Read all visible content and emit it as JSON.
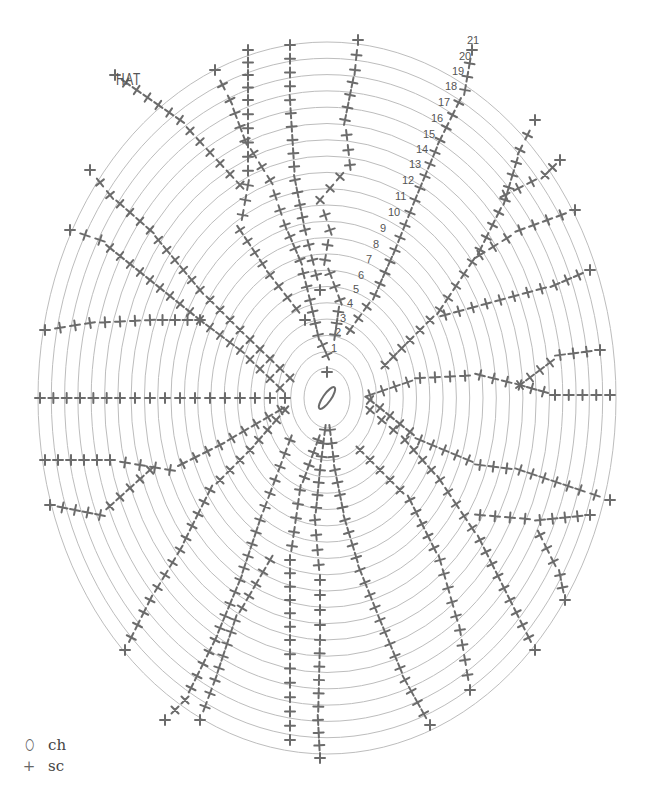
{
  "title": "HAT",
  "legend": [
    {
      "symbol": "oval",
      "glyph": "⬯",
      "label": "ch"
    },
    {
      "symbol": "plus",
      "glyph": "+",
      "label": "sc"
    }
  ],
  "colors": {
    "ring": "#bdbdbd",
    "stitch": "#6b6b6b",
    "text": "#555555"
  },
  "diagram": {
    "center": [
      327,
      398
    ],
    "rounds": 21,
    "ring_rx_start": 23,
    "ring_rx_step": 13.3,
    "ring_ry_start": 30,
    "ring_ry_step": 16.3,
    "round_labels": [
      "1",
      "2",
      "3",
      "4",
      "5",
      "6",
      "7",
      "8",
      "9",
      "10",
      "11",
      "12",
      "13",
      "14",
      "15",
      "16",
      "17",
      "18",
      "19",
      "20",
      "21"
    ],
    "round_label_positions": [
      [
        331,
        352
      ],
      [
        335,
        336
      ],
      [
        340,
        322
      ],
      [
        347,
        307
      ],
      [
        353,
        293
      ],
      [
        358,
        279
      ],
      [
        366,
        263
      ],
      [
        373,
        248
      ],
      [
        380,
        232
      ],
      [
        388,
        216
      ],
      [
        395,
        200
      ],
      [
        402,
        184
      ],
      [
        409,
        168
      ],
      [
        416,
        153
      ],
      [
        423,
        138
      ],
      [
        431,
        122
      ],
      [
        438,
        106
      ],
      [
        445,
        90
      ],
      [
        452,
        75
      ],
      [
        459,
        60
      ],
      [
        467,
        44
      ]
    ],
    "spokes": [
      {
        "name": "spoke-top",
        "pts": [
          [
            327,
            372
          ],
          [
            327,
            355
          ],
          [
            318,
            335
          ],
          [
            310,
            300
          ],
          [
            300,
            260
          ],
          [
            285,
            225
          ],
          [
            270,
            180
          ],
          [
            245,
            140
          ],
          [
            230,
            100
          ],
          [
            215,
            70
          ]
        ]
      },
      {
        "name": "spoke-top-2",
        "pts": [
          [
            335,
            335
          ],
          [
            340,
            300
          ],
          [
            325,
            260
          ],
          [
            330,
            230
          ],
          [
            320,
            200
          ],
          [
            350,
            165
          ],
          [
            345,
            120
          ],
          [
            355,
            70
          ],
          [
            358,
            40
          ]
        ]
      },
      {
        "name": "spoke-top-3",
        "pts": [
          [
            248,
            50
          ],
          [
            248,
            100
          ],
          [
            248,
            185
          ],
          [
            240,
            230
          ],
          [
            270,
            275
          ],
          [
            305,
            320
          ]
        ]
      },
      {
        "name": "spoke-top-4",
        "pts": [
          [
            290,
            45
          ],
          [
            290,
            100
          ],
          [
            295,
            180
          ],
          [
            305,
            230
          ],
          [
            320,
            290
          ]
        ]
      },
      {
        "name": "spoke-diag",
        "pts": [
          [
            350,
            330
          ],
          [
            375,
            295
          ],
          [
            395,
            250
          ],
          [
            415,
            200
          ],
          [
            440,
            140
          ],
          [
            465,
            90
          ],
          [
            472,
            50
          ]
        ]
      },
      {
        "name": "spoke-ne",
        "pts": [
          [
            385,
            365
          ],
          [
            410,
            340
          ],
          [
            440,
            310
          ],
          [
            480,
            250
          ],
          [
            505,
            200
          ],
          [
            520,
            150
          ],
          [
            535,
            120
          ]
        ]
      },
      {
        "name": "spoke-ne-b",
        "pts": [
          [
            480,
            255
          ],
          [
            520,
            230
          ],
          [
            575,
            210
          ]
        ]
      },
      {
        "name": "spoke-ne-c",
        "pts": [
          [
            505,
            195
          ],
          [
            545,
            175
          ],
          [
            560,
            160
          ]
        ]
      },
      {
        "name": "spoke-e1",
        "pts": [
          [
            445,
            315
          ],
          [
            500,
            300
          ],
          [
            555,
            285
          ],
          [
            590,
            270
          ]
        ]
      },
      {
        "name": "spoke-e2",
        "pts": [
          [
            370,
            395
          ],
          [
            420,
            378
          ],
          [
            480,
            375
          ],
          [
            520,
            385
          ],
          [
            560,
            355
          ],
          [
            600,
            350
          ]
        ]
      },
      {
        "name": "spoke-e3",
        "pts": [
          [
            520,
            385
          ],
          [
            555,
            395
          ],
          [
            610,
            395
          ]
        ]
      },
      {
        "name": "spoke-e4",
        "pts": [
          [
            370,
            400
          ],
          [
            420,
            440
          ],
          [
            480,
            465
          ],
          [
            520,
            470
          ],
          [
            580,
            490
          ],
          [
            610,
            500
          ]
        ]
      },
      {
        "name": "spoke-se",
        "pts": [
          [
            370,
            410
          ],
          [
            405,
            440
          ],
          [
            440,
            480
          ],
          [
            480,
            540
          ],
          [
            510,
            600
          ],
          [
            535,
            650
          ]
        ]
      },
      {
        "name": "spoke-se-b",
        "pts": [
          [
            480,
            515
          ],
          [
            540,
            520
          ],
          [
            590,
            515
          ]
        ]
      },
      {
        "name": "spoke-se-c",
        "pts": [
          [
            540,
            535
          ],
          [
            560,
            575
          ],
          [
            565,
            600
          ]
        ]
      },
      {
        "name": "spoke-s1",
        "pts": [
          [
            330,
            430
          ],
          [
            335,
            470
          ],
          [
            345,
            520
          ],
          [
            360,
            570
          ],
          [
            380,
            620
          ],
          [
            405,
            680
          ],
          [
            430,
            725
          ]
        ]
      },
      {
        "name": "spoke-s2",
        "pts": [
          [
            325,
            430
          ],
          [
            320,
            470
          ],
          [
            315,
            520
          ],
          [
            320,
            580
          ],
          [
            320,
            640
          ],
          [
            318,
            720
          ],
          [
            320,
            758
          ]
        ]
      },
      {
        "name": "spoke-s3",
        "pts": [
          [
            318,
            440
          ],
          [
            300,
            490
          ],
          [
            290,
            560
          ],
          [
            290,
            640
          ],
          [
            290,
            740
          ]
        ]
      },
      {
        "name": "spoke-s4",
        "pts": [
          [
            360,
            450
          ],
          [
            410,
            500
          ],
          [
            440,
            560
          ],
          [
            460,
            630
          ],
          [
            470,
            690
          ]
        ]
      },
      {
        "name": "spoke-sw",
        "pts": [
          [
            285,
            410
          ],
          [
            250,
            450
          ],
          [
            210,
            490
          ],
          [
            180,
            550
          ],
          [
            150,
            600
          ],
          [
            125,
            650
          ]
        ]
      },
      {
        "name": "spoke-sw2",
        "pts": [
          [
            290,
            440
          ],
          [
            260,
            520
          ],
          [
            240,
            580
          ],
          [
            215,
            640
          ],
          [
            185,
            700
          ],
          [
            165,
            720
          ]
        ]
      },
      {
        "name": "spoke-sw3",
        "pts": [
          [
            270,
            560
          ],
          [
            235,
            620
          ],
          [
            215,
            680
          ],
          [
            200,
            720
          ]
        ]
      },
      {
        "name": "spoke-w1",
        "pts": [
          [
            285,
            398
          ],
          [
            240,
            398
          ],
          [
            180,
            398
          ],
          [
            120,
            398
          ],
          [
            40,
            398
          ]
        ]
      },
      {
        "name": "spoke-w2",
        "pts": [
          [
            280,
            410
          ],
          [
            220,
            445
          ],
          [
            170,
            470
          ],
          [
            110,
            460
          ],
          [
            45,
            460
          ]
        ]
      },
      {
        "name": "spoke-w3",
        "pts": [
          [
            150,
            470
          ],
          [
            100,
            515
          ],
          [
            50,
            505
          ]
        ]
      },
      {
        "name": "spoke-nw1",
        "pts": [
          [
            280,
            388
          ],
          [
            240,
            350
          ],
          [
            200,
            320
          ],
          [
            150,
            320
          ],
          [
            90,
            323
          ],
          [
            45,
            330
          ]
        ]
      },
      {
        "name": "spoke-nw2",
        "pts": [
          [
            200,
            320
          ],
          [
            150,
            280
          ],
          [
            100,
            240
          ],
          [
            70,
            230
          ]
        ]
      },
      {
        "name": "spoke-nw3",
        "pts": [
          [
            290,
            378
          ],
          [
            240,
            330
          ],
          [
            200,
            290
          ],
          [
            150,
            230
          ],
          [
            110,
            195
          ],
          [
            90,
            170
          ]
        ]
      },
      {
        "name": "spoke-nw4",
        "pts": [
          [
            240,
            185
          ],
          [
            180,
            120
          ],
          [
            115,
            75
          ]
        ]
      }
    ]
  }
}
